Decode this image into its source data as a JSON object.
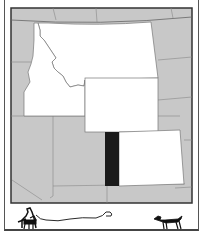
{
  "map": {
    "highlighted_states": [
      "Montana",
      "Idaho",
      "Wyoming",
      "Colorado"
    ],
    "marked_region": "Utah (eastern strip)",
    "colors": {
      "background_states": "#c8c8c8",
      "highlighted": "#ffffff",
      "marked": "#1a1a1a",
      "border": "#777777",
      "frame": "#333333"
    }
  },
  "illustration": {
    "left": "person-with-dog-and-broken-leash",
    "right": "dog-running"
  }
}
